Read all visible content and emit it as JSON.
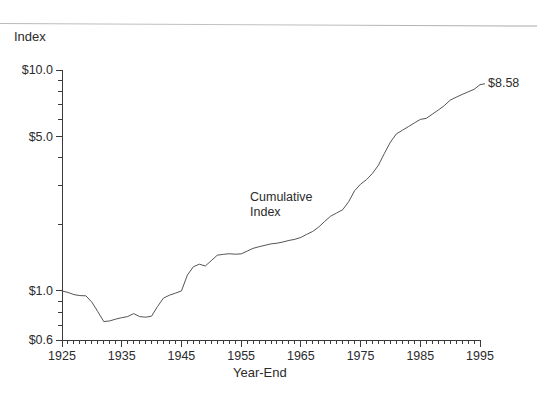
{
  "figure": {
    "background_color": "#ffffff",
    "line_color": "#555555",
    "axis_color": "#3a3a3a",
    "text_color": "#2b2b2b"
  },
  "y_axis_title": "Index",
  "x_axis_title": "Year-End",
  "series_annotation_line1": "Cumulative",
  "series_annotation_line2": "Index",
  "endpoint_label": "$8.58",
  "y_tick_labels": [
    "$10.0",
    "$5.0",
    "$1.0",
    "$0.6"
  ],
  "x_tick_labels": [
    "1925",
    "1935",
    "1945",
    "1955",
    "1965",
    "1975",
    "1985",
    "1995"
  ],
  "chart_data": {
    "type": "line",
    "title": "",
    "subtitle": "",
    "xlabel": "Year-End",
    "ylabel": "Index",
    "yscale": "log",
    "xscale": "linear",
    "ylim": [
      0.6,
      10.0
    ],
    "xlim": [
      1925,
      1995
    ],
    "grid": false,
    "legend_position": "none",
    "y_major_ticks": [
      0.6,
      1.0,
      5.0,
      10.0
    ],
    "y_major_tick_labels": [
      "$0.6",
      "$1.0",
      "$5.0",
      "$10.0"
    ],
    "y_minor_ticks": [
      0.7,
      0.8,
      0.9,
      2,
      3,
      4,
      6,
      7,
      8,
      9
    ],
    "x_major_ticks": [
      1925,
      1935,
      1945,
      1955,
      1965,
      1975,
      1985,
      1995
    ],
    "x_minor_tick_interval": 1,
    "annotations": [
      {
        "text": "Cumulative Index",
        "x": 1957,
        "y": 2.45
      },
      {
        "text": "$8.58",
        "x": 1995,
        "y": 8.58
      }
    ],
    "series": [
      {
        "name": "Cumulative Index",
        "x": [
          1925,
          1926,
          1927,
          1928,
          1929,
          1930,
          1931,
          1932,
          1933,
          1934,
          1935,
          1936,
          1937,
          1938,
          1939,
          1940,
          1941,
          1942,
          1943,
          1944,
          1945,
          1946,
          1947,
          1948,
          1949,
          1950,
          1951,
          1952,
          1953,
          1954,
          1955,
          1956,
          1957,
          1958,
          1959,
          1960,
          1961,
          1962,
          1963,
          1964,
          1965,
          1966,
          1967,
          1968,
          1969,
          1970,
          1971,
          1972,
          1973,
          1974,
          1975,
          1976,
          1977,
          1978,
          1979,
          1980,
          1981,
          1982,
          1983,
          1984,
          1985,
          1986,
          1987,
          1988,
          1989,
          1990,
          1991,
          1992,
          1993,
          1994,
          1995
        ],
        "values": [
          1.0,
          0.985,
          0.963,
          0.953,
          0.951,
          0.89,
          0.806,
          0.727,
          0.732,
          0.746,
          0.757,
          0.766,
          0.79,
          0.766,
          0.761,
          0.769,
          0.851,
          0.929,
          0.957,
          0.978,
          1.0,
          1.18,
          1.287,
          1.322,
          1.297,
          1.372,
          1.452,
          1.465,
          1.474,
          1.467,
          1.472,
          1.515,
          1.559,
          1.586,
          1.61,
          1.634,
          1.645,
          1.666,
          1.693,
          1.713,
          1.747,
          1.805,
          1.861,
          1.948,
          2.066,
          2.181,
          2.255,
          2.331,
          2.533,
          2.843,
          3.043,
          3.19,
          3.406,
          3.713,
          4.198,
          4.718,
          5.14,
          5.336,
          5.54,
          5.757,
          5.975,
          6.041,
          6.307,
          6.584,
          6.89,
          7.303,
          7.527,
          7.75,
          7.96,
          8.174,
          8.58
        ]
      }
    ]
  }
}
